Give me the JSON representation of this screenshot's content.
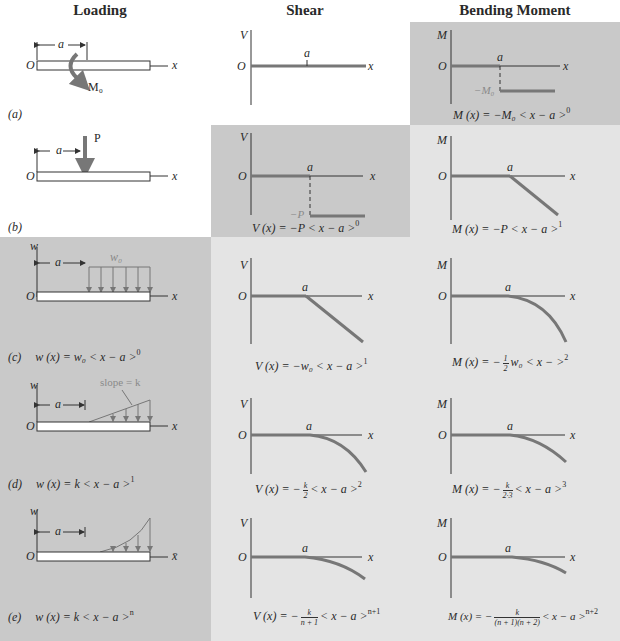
{
  "headers": {
    "loading": "Loading",
    "shear": "Shear",
    "moment": "Bending Moment"
  },
  "colors": {
    "curve": "#777777",
    "axis": "#333333",
    "dark_panel": "#c9c9c9",
    "light_panel": "#e4e4e4"
  },
  "axes": {
    "origin": "O",
    "x": "x",
    "x_bar": "x̄",
    "v": "V",
    "m": "M",
    "w": "w",
    "a": "a"
  },
  "cases": [
    {
      "tag": "(a)",
      "load_label": "M₀",
      "shear_eq": "",
      "moment_eq_pre": "M (x) = −M₀ < x − a >",
      "moment_eq_exp": "0",
      "moment_level": "−M₀"
    },
    {
      "tag": "(b)",
      "load_label": "P",
      "shear_eq_pre": "V (x) = −P < x − a >",
      "shear_eq_exp": "0",
      "shear_level": "−P",
      "moment_eq_pre": "M (x) = −P < x − a >",
      "moment_eq_exp": "1"
    },
    {
      "tag": "(c)",
      "load_label": "w₀",
      "load_eq_pre": "w (x) = w₀ < x − a >",
      "load_eq_exp": "0",
      "shear_eq_pre": "V (x) = −w₀ < x − a >",
      "shear_eq_exp": "1",
      "moment_eq_pre": "M (x) = −",
      "moment_frac_num": "1",
      "moment_frac_den": "2",
      "moment_eq_post": "w₀ < x − >",
      "moment_eq_exp": "2"
    },
    {
      "tag": "(d)",
      "load_label": "slope = k",
      "load_eq_pre": "w (x) = k < x − a >",
      "load_eq_exp": "1",
      "shear_eq_pre": "V (x) = −",
      "shear_frac_num": "k",
      "shear_frac_den": "2",
      "shear_eq_post": "< x − a >",
      "shear_eq_exp": "2",
      "moment_eq_pre": "M (x) = −",
      "moment_frac_num": "k",
      "moment_frac_den": "2·3",
      "moment_eq_post": "< x − a >",
      "moment_eq_exp": "3"
    },
    {
      "tag": "(e)",
      "load_eq_pre": "w (x) = k < x − a >",
      "load_eq_exp": "n",
      "shear_eq_pre": "V (x) = −",
      "shear_frac_num": "k",
      "shear_frac_den": "n + 1",
      "shear_eq_post": "< x − a >",
      "shear_eq_exp": "n+1",
      "moment_eq_pre": "M (x) = −",
      "moment_frac_num": "k",
      "moment_frac_den": "(n + 1)(n + 2)",
      "moment_eq_post": "< x − a >",
      "moment_eq_exp": "n+2"
    }
  ]
}
